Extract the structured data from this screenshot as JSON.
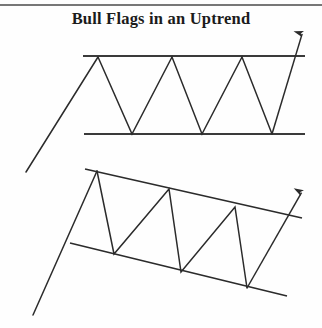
{
  "figure": {
    "title": "Bull Flags in an Uptrend",
    "background_color": "#fefefe",
    "stroke_color": "#2b2b2b",
    "top_border": {
      "y": 5,
      "x1": 0,
      "x2": 322,
      "width": 1.6
    }
  },
  "chart_data": {
    "type": "line",
    "title": "Bull Flags in an Uptrend",
    "subtitle": "",
    "xlabel": "",
    "ylabel": "",
    "grid": false,
    "legend": null,
    "axis_ranges": {
      "x": [
        0,
        322
      ],
      "y": [
        0,
        328
      ]
    },
    "annotations": [
      "Upper pattern: horizontal rectangle consolidation after an uptrend, breakout arrow up",
      "Lower pattern: down-sloping parallel channel (bull flag) after an uptrend, breakout arrow up"
    ],
    "patterns": [
      {
        "name": "horizontal-rectangle-bull-flag",
        "label": "Upper bull flag (horizontal channel)",
        "flagpole": {
          "x": [
            26,
            98
          ],
          "y": [
            172,
            57
          ]
        },
        "upper_boundary": {
          "x": [
            83,
            305
          ],
          "y": [
            56,
            56
          ]
        },
        "lower_boundary": {
          "x": [
            84,
            305
          ],
          "y": [
            134,
            134
          ]
        },
        "zigzag": {
          "x": [
            98,
            132,
            172,
            202,
            242,
            272,
            303
          ],
          "y": [
            57,
            134,
            57,
            134,
            57,
            134,
            31
          ]
        },
        "breakout_arrow": {
          "from": [
            272,
            134
          ],
          "to": [
            303,
            31
          ],
          "direction": "up"
        }
      },
      {
        "name": "down-sloping-channel-bull-flag",
        "label": "Lower bull flag (down-sloping channel)",
        "flagpole": {
          "x": [
            33,
            97
          ],
          "y": [
            315,
            171
          ]
        },
        "upper_boundary": {
          "x": [
            85,
            302
          ],
          "y": [
            169,
            218
          ]
        },
        "lower_boundary": {
          "x": [
            70,
            287
          ],
          "y": [
            243,
            296
          ]
        },
        "zigzag": {
          "x": [
            97,
            114,
            169,
            181,
            235,
            247,
            303
          ],
          "y": [
            171,
            254,
            189,
            272,
            207,
            288,
            190
          ]
        },
        "breakout_arrow": {
          "from": [
            247,
            288
          ],
          "to": [
            303,
            190
          ],
          "direction": "up"
        }
      }
    ]
  }
}
